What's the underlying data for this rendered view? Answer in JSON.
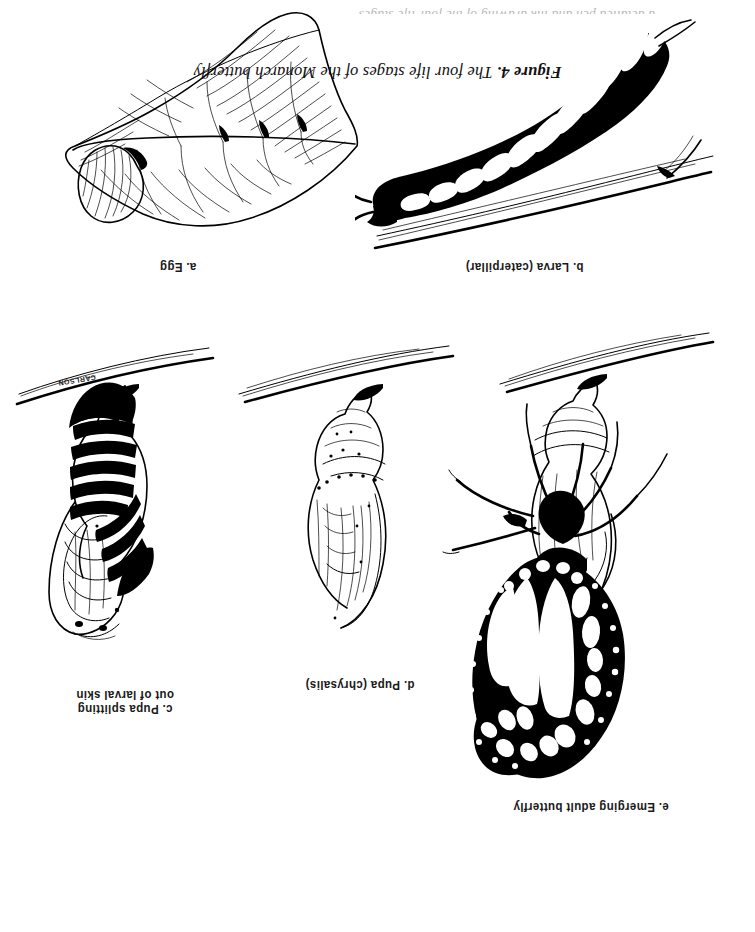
{
  "document": {
    "type": "scanned-figure-page",
    "orientation": "upside-down",
    "background_color": "#ffffff",
    "ink_color": "#000000",
    "cut_off_top_line": "a detailed pen and ink drawing of the four life stages"
  },
  "caption": {
    "figure_number": "Figure 4.",
    "text": "The four life stages of the Monarch butterfly",
    "full": "Figure 4.  The four life stages of the Monarch butterfly"
  },
  "panels": [
    {
      "key": "a",
      "label": "a. Egg",
      "subject": "monarch egg on a milkweed leaf",
      "row": "bottom",
      "column": "right"
    },
    {
      "key": "b",
      "label": "b. Larva (caterpillar)",
      "subject": "striped monarch caterpillar crawling on a branch",
      "row": "bottom",
      "column": "left"
    },
    {
      "key": "c",
      "label": "c. Pupa splitting\nout of larval skin",
      "subject": "pupa emerging from the striped larval skin, hanging from a twig",
      "row": "top",
      "column": "right"
    },
    {
      "key": "d",
      "label": "d. Pupa (chrysalis)",
      "subject": "smooth monarch chrysalis hanging from a twig",
      "row": "top",
      "column": "center"
    },
    {
      "key": "e",
      "label": "e. Emerging adult butterfly",
      "subject": "adult monarch butterfly clinging to the empty chrysalis case",
      "row": "top",
      "column": "left"
    }
  ],
  "signature": {
    "text": "CARLSON"
  }
}
